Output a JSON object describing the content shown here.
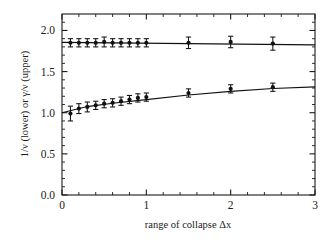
{
  "figure": {
    "background_color": "#ffffff",
    "ink_color": "#111111"
  },
  "chart_data": {
    "type": "scatter",
    "title": "",
    "xlabel": "range of collapse Δx",
    "ylabel": "1/ν (lower) or γ/ν (upper)",
    "xlim": [
      0,
      3
    ],
    "ylim": [
      0,
      2.2
    ],
    "grid": false,
    "legend": null,
    "x_ticks_major": [
      0,
      1,
      2,
      3
    ],
    "x_ticklabels": [
      "0",
      "1",
      "2",
      "3"
    ],
    "x_ticks_minor": [
      0.2,
      0.4,
      0.6,
      0.8,
      1.2,
      1.4,
      1.6,
      1.8,
      2.2,
      2.4,
      2.6,
      2.8
    ],
    "y_ticks_major": [
      0.0,
      0.5,
      1.0,
      1.5,
      2.0
    ],
    "y_ticklabels": [
      "0.0",
      "0.5",
      "1.0",
      "1.5",
      "2.0"
    ],
    "y_ticks_minor": [
      0.1,
      0.2,
      0.3,
      0.4,
      0.6,
      0.7,
      0.8,
      0.9,
      1.1,
      1.2,
      1.3,
      1.4,
      1.6,
      1.7,
      1.8,
      1.9,
      2.1
    ],
    "series": [
      {
        "name": "γ/ν (upper)",
        "marker": "filled-circle",
        "x": [
          0.1,
          0.2,
          0.3,
          0.4,
          0.5,
          0.6,
          0.7,
          0.8,
          0.9,
          1.0,
          1.5,
          2.0,
          2.5
        ],
        "y": [
          1.85,
          1.85,
          1.85,
          1.85,
          1.86,
          1.85,
          1.85,
          1.85,
          1.85,
          1.85,
          1.85,
          1.86,
          1.84
        ],
        "yerr": [
          0.05,
          0.05,
          0.05,
          0.05,
          0.06,
          0.05,
          0.05,
          0.05,
          0.05,
          0.05,
          0.07,
          0.07,
          0.08
        ]
      },
      {
        "name": "1/ν (lower)",
        "marker": "filled-circle",
        "x": [
          0.1,
          0.2,
          0.3,
          0.4,
          0.5,
          0.6,
          0.7,
          0.8,
          0.9,
          1.0,
          1.5,
          2.0,
          2.5
        ],
        "y": [
          0.99,
          1.05,
          1.07,
          1.09,
          1.11,
          1.12,
          1.14,
          1.16,
          1.18,
          1.19,
          1.24,
          1.29,
          1.31
        ],
        "yerr": [
          0.09,
          0.06,
          0.06,
          0.05,
          0.05,
          0.05,
          0.05,
          0.05,
          0.05,
          0.05,
          0.05,
          0.05,
          0.05
        ]
      }
    ],
    "fits": [
      {
        "name": "upper-fit-line",
        "x": [
          0.0,
          3.0
        ],
        "y": [
          1.855,
          1.825
        ]
      },
      {
        "name": "lower-fit-line",
        "x": [
          0.0,
          0.3,
          0.6,
          1.0,
          1.5,
          2.0,
          2.5,
          3.0
        ],
        "y": [
          1.0,
          1.075,
          1.115,
          1.16,
          1.215,
          1.26,
          1.295,
          1.315
        ]
      }
    ]
  }
}
